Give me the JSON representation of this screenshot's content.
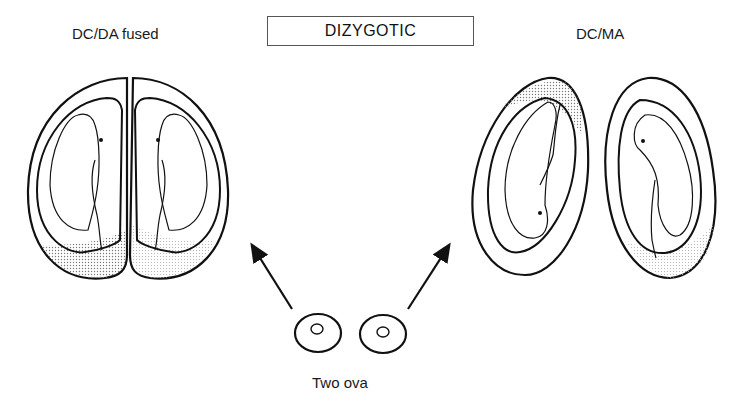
{
  "diagram": {
    "title": "DIZYGOTIC",
    "left_label": "DC/DA fused",
    "right_label": "DC/MA",
    "bottom_label": "Two ova",
    "colors": {
      "stroke": "#111111",
      "stipple": "#888888",
      "background": "#ffffff"
    }
  }
}
